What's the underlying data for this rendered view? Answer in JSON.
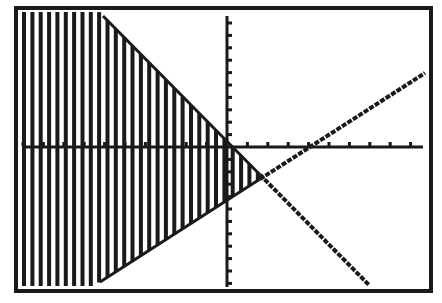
{
  "screen": {
    "title": "Graphing calculator screen: shaded system of linear inequalities",
    "background": "#ffffff",
    "ink": "#1a1a1a"
  },
  "chart_data": {
    "type": "line",
    "title": "",
    "xlabel": "",
    "ylabel": "",
    "grid": false,
    "legend": null,
    "axes": {
      "x_axis_ticks_visible": true,
      "y_axis_ticks_visible": true,
      "tick_labels": "none"
    },
    "window": {
      "xmin": -10,
      "xmax": 10,
      "ymin": -10,
      "ymax": 10,
      "xscl": 1,
      "yscl": 1
    },
    "series": [
      {
        "name": "increasing line (lower boundary)",
        "style": "line",
        "points_px": [
          [
            100,
            282
          ],
          [
            425,
            73
          ]
        ],
        "approx_points": [
          [
            -6,
            -10.2
          ],
          [
            9.8,
            5.2
          ]
        ]
      },
      {
        "name": "decreasing line (upper boundary)",
        "style": "line",
        "points_px": [
          [
            103,
            16
          ],
          [
            369,
            285
          ]
        ],
        "approx_points": [
          [
            -6,
            9.5
          ],
          [
            7,
            -10
          ]
        ]
      }
    ],
    "shading": {
      "pattern": "vertical-stripes",
      "region": "below decreasing line and above increasing line (left of intersection)",
      "intersection_px": [
        260,
        176
      ],
      "intersection_approx": [
        1.6,
        -2.0
      ]
    }
  },
  "layout": {
    "frame": {
      "x": 14,
      "y": 6,
      "w": 419,
      "h": 287,
      "stroke": 4
    },
    "plot": {
      "left": 20,
      "top": 12,
      "right": 427,
      "bottom": 286
    },
    "x_axis_y": 147,
    "y_axis_x": 227,
    "x_tick_px": 20.4,
    "y_tick_px": 12.4,
    "stripe_start": 22,
    "stripe_step": 8.35,
    "stripe_width": 4
  }
}
